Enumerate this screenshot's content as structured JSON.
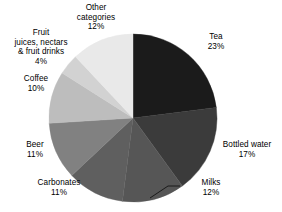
{
  "chart_data": {
    "type": "pie",
    "title": "",
    "subtitle": "",
    "xlabel": "",
    "ylabel": "",
    "legend_position": "none",
    "grid": false,
    "unit": "%",
    "total": 100,
    "start_angle_deg": 0,
    "direction": "clockwise",
    "categories": [
      "Tea",
      "Bottled water",
      "Milks",
      "Carbonates",
      "Beer",
      "Coffee",
      "Fruit juices, nectars & fruit drinks",
      "Other categories"
    ],
    "values": [
      23,
      17,
      12,
      11,
      11,
      10,
      4,
      12
    ],
    "colors": [
      "#1b1b1b",
      "#3b3b3b",
      "#565656",
      "#5f5f5f",
      "#818181",
      "#bdbdbd",
      "#d2d2d2",
      "#e9e9e9"
    ],
    "slices": [
      {
        "name": "Tea",
        "value": 23,
        "value_label": "23%",
        "label_lines": [
          "Tea",
          "23%"
        ],
        "color": "#1b1b1b"
      },
      {
        "name": "Bottled water",
        "value": 17,
        "value_label": "17%",
        "label_lines": [
          "Bottled water",
          "17%"
        ],
        "color": "#3b3b3b"
      },
      {
        "name": "Milks",
        "value": 12,
        "value_label": "12%",
        "label_lines": [
          "Milks",
          "12%"
        ],
        "color": "#565656"
      },
      {
        "name": "Carbonates",
        "value": 11,
        "value_label": "11%",
        "label_lines": [
          "Carbonates",
          "11%"
        ],
        "color": "#5f5f5f"
      },
      {
        "name": "Beer",
        "value": 11,
        "value_label": "11%",
        "label_lines": [
          "Beer",
          "11%"
        ],
        "color": "#818181"
      },
      {
        "name": "Coffee",
        "value": 10,
        "value_label": "10%",
        "label_lines": [
          "Coffee",
          "10%"
        ],
        "color": "#bdbdbd"
      },
      {
        "name": "Fruit juices, nectars & fruit drinks",
        "value": 4,
        "value_label": "4%",
        "label_lines": [
          "Fruit",
          "juices, nectars",
          "& fruit drinks",
          "4%"
        ],
        "color": "#d2d2d2"
      },
      {
        "name": "Other categories",
        "value": 12,
        "value_label": "12%",
        "label_lines": [
          "Other",
          "categories",
          "12%"
        ],
        "color": "#e9e9e9"
      }
    ]
  },
  "labels": {
    "tea": "Tea\n23%",
    "bottled_water": "Bottled water\n17%",
    "milks": "Milks\n12%",
    "carbonates": "Carbonates\n11%",
    "beer": "Beer\n11%",
    "coffee": "Coffee\n10%",
    "fruit_juices": "Fruit\njuices, nectars\n& fruit drinks\n4%",
    "other_categories": "Other\ncategories\n12%"
  },
  "geometry": {
    "center_x": 133,
    "center_y": 118,
    "radius": 84
  }
}
